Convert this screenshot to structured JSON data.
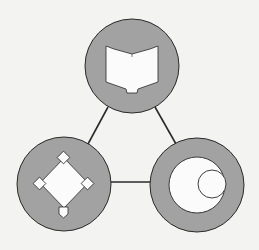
{
  "diagram": {
    "type": "triangle-network",
    "background": "#f3f3f1",
    "node_fill": "#a2a2a2",
    "icon_fill": "#fbfbfb",
    "stroke": "#2a2a2a",
    "nodes": [
      {
        "id": "top",
        "icon": "open-book-icon",
        "cx": 132,
        "cy": 66,
        "r": 47
      },
      {
        "id": "bottom-left",
        "icon": "baseball-diamond-icon",
        "cx": 64,
        "cy": 184,
        "r": 47
      },
      {
        "id": "bottom-right",
        "icon": "concentric-circles-icon",
        "cx": 197,
        "cy": 185,
        "r": 47
      }
    ],
    "edges": [
      {
        "from": "top",
        "to": "bottom-left"
      },
      {
        "from": "top",
        "to": "bottom-right"
      },
      {
        "from": "bottom-left",
        "to": "bottom-right"
      }
    ]
  }
}
